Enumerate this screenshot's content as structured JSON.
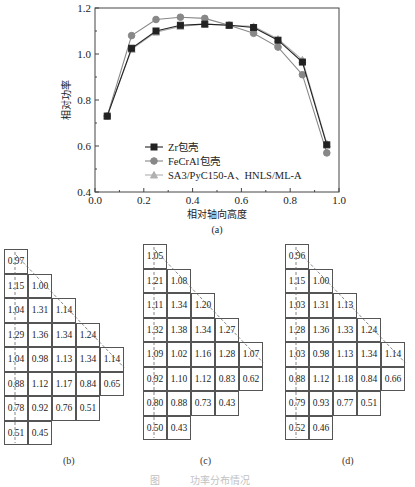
{
  "chart_data": [
    {
      "type": "line",
      "title": "",
      "xlabel": "相对轴向高度",
      "ylabel": "相对功率",
      "xlim": [
        0.0,
        1.0
      ],
      "ylim": [
        0.4,
        1.2
      ],
      "x_ticks": [
        "0.0",
        "0.2",
        "0.4",
        "0.6",
        "0.8",
        "1.0"
      ],
      "y_ticks": [
        "0.4",
        "0.6",
        "0.8",
        "1.0",
        "1.2"
      ],
      "x": [
        0.05,
        0.15,
        0.25,
        0.35,
        0.45,
        0.55,
        0.65,
        0.75,
        0.85,
        0.95
      ],
      "series": [
        {
          "name": "Zr包壳",
          "marker": "square",
          "color": "#222222",
          "values": [
            0.73,
            1.025,
            1.1,
            1.125,
            1.13,
            1.125,
            1.115,
            1.06,
            0.965,
            0.605
          ]
        },
        {
          "name": "FeCrAl包壳",
          "marker": "circle",
          "color": "#888888",
          "values": [
            0.73,
            1.08,
            1.15,
            1.16,
            1.155,
            1.125,
            1.09,
            1.03,
            0.91,
            0.57
          ]
        },
        {
          "name": "SA3/PyC150-A、HNLS/ML-A",
          "marker": "triangle",
          "color": "#b0b0b0",
          "values": [
            0.73,
            1.02,
            1.095,
            1.12,
            1.13,
            1.125,
            1.12,
            1.065,
            0.975,
            0.61
          ]
        }
      ],
      "legend_position": "lower-left",
      "grid": false,
      "panel_label": "(a)"
    },
    {
      "type": "table",
      "panel_label": "(b)",
      "rows": [
        [
          "0.97"
        ],
        [
          "1.15",
          "1.00"
        ],
        [
          "1.04",
          "1.31",
          "1.14"
        ],
        [
          "1.29",
          "1.36",
          "1.34",
          "1.24"
        ],
        [
          "1.04",
          "0.98",
          "1.13",
          "1.34",
          "1.14"
        ],
        [
          "0.88",
          "1.12",
          "1.17",
          "0.84",
          "0.65"
        ],
        [
          "0.78",
          "0.92",
          "0.76",
          "0.51"
        ],
        [
          "0.51",
          "0.45"
        ]
      ]
    },
    {
      "type": "table",
      "panel_label": "(c)",
      "rows": [
        [
          "1.05"
        ],
        [
          "1.21",
          "1.08"
        ],
        [
          "1.11",
          "1.34",
          "1.20"
        ],
        [
          "1.32",
          "1.38",
          "1.34",
          "1.27"
        ],
        [
          "1.09",
          "1.02",
          "1.16",
          "1.28",
          "1.07"
        ],
        [
          "0.92",
          "1.10",
          "1.12",
          "0.83",
          "0.62"
        ],
        [
          "0.80",
          "0.88",
          "0.73",
          "0.43"
        ],
        [
          "0.50",
          "0.43"
        ]
      ]
    },
    {
      "type": "table",
      "panel_label": "(d)",
      "rows": [
        [
          "0.96"
        ],
        [
          "1.15",
          "1.00"
        ],
        [
          "1.03",
          "1.31",
          "1.13"
        ],
        [
          "1.28",
          "1.36",
          "1.33",
          "1.24"
        ],
        [
          "1.03",
          "0.98",
          "1.13",
          "1.34",
          "1.14"
        ],
        [
          "0.88",
          "1.12",
          "1.18",
          "0.84",
          "0.66"
        ],
        [
          "0.79",
          "0.93",
          "0.77",
          "0.51"
        ],
        [
          "0.52",
          "0.46"
        ]
      ]
    }
  ],
  "labels": {
    "a": "(a)",
    "b": "(b)",
    "c": "(c)",
    "d": "(d)",
    "caption": "图　　　功率分布情况"
  }
}
